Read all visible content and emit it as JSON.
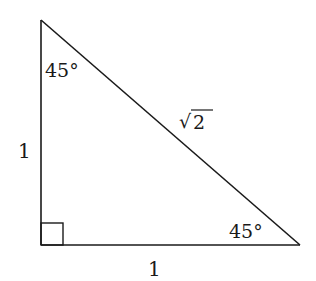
{
  "diagram": {
    "type": "right-isosceles-triangle",
    "stroke_color": "#1a1a1a",
    "background": "#ffffff",
    "vertices": {
      "top": [
        41,
        20
      ],
      "right_angle": [
        41,
        245
      ],
      "bottom_right": [
        300,
        245
      ]
    },
    "labels": {
      "top_angle": "45°",
      "bottom_right_angle": "45°",
      "hypotenuse_radical": "√",
      "hypotenuse_radicand": "2",
      "left_leg": "1",
      "bottom_leg": "1"
    },
    "right_angle_marker": "square"
  }
}
